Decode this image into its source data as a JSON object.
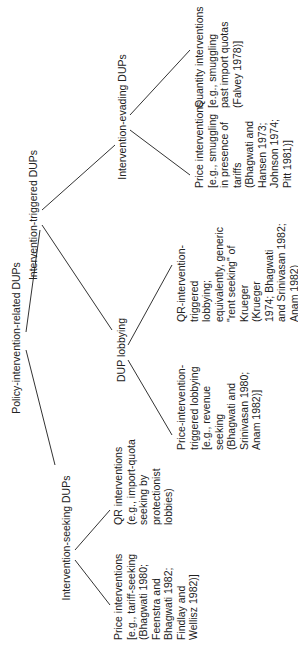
{
  "diagram": {
    "root": "Policy-intervention-related DUPs",
    "level1": {
      "seeking": "Intervention-seeking DUPs",
      "triggered": "Intervention-triggered DUPs"
    },
    "level2": {
      "lobbying": "DUP lobbying",
      "evading": "Intervention-evading DUPs"
    },
    "leaves": {
      "seeking_price": "Price interventions\n[e.g., tariff-seeking\n(Bhagwati 1980;\nFeenstra and\nBhagwati 1982;\nFindlay and\nWellisz 1982)]",
      "seeking_qr": "QR interventions\n(e.g., import-quota\nseeking by\nprotectionist\nlobbies)",
      "lobbying_price": "Price-intervention-\ntriggered lobbying\n[e.g., revenue\nseeking\n(Bhagwati and\nSrinivasan 1980;\nAnam 1982)]",
      "lobbying_qr": "QR-intervention-\ntriggered\nlobbying;\nequivalently, generic\n\"rent seeking\" of\nKrueger\n(Krueger\n1974; Bhagwati\nand Srinivasan 1982;\nAnam 1982)",
      "evading_price": "Price interventions\n[e.g., smuggling\nin presence of\ntariffs\n(Bhagwati and\nHansen 1973;\nJohnson 1974;\nPitt 1981)]",
      "evading_quantity": "Quantity interventions\n[e.g., smuggling\npast import quotas\n(Falvey 1978)]"
    },
    "line_color": "#333333",
    "text_color": "#222222"
  }
}
